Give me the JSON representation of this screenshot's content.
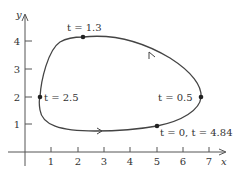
{
  "axes": {
    "x_label": "x",
    "y_label": "y",
    "x_ticks": [
      "1",
      "2",
      "3",
      "4",
      "5",
      "6",
      "7"
    ],
    "y_ticks": [
      "1",
      "2",
      "3",
      "4"
    ]
  },
  "curve": {
    "description": "Closed parametric curve traversed counterclockwise",
    "stroke_color": "#444444"
  },
  "points": [
    {
      "t_text": "t = 1.3",
      "x": 2.2,
      "y": 4.15
    },
    {
      "t_text": "t = 2.5",
      "x": 0.6,
      "y": 2.0
    },
    {
      "t_text": "t = 0.5",
      "x": 6.7,
      "y": 2.0
    },
    {
      "t_text": "t = 0, t = 4.84",
      "x": 5.0,
      "y": 0.95
    }
  ],
  "labels": {
    "p0": "t = 1.3",
    "p1": "t = 2.5",
    "p2": "t = 0.5",
    "p3": "t = 0, t = 4.84"
  }
}
